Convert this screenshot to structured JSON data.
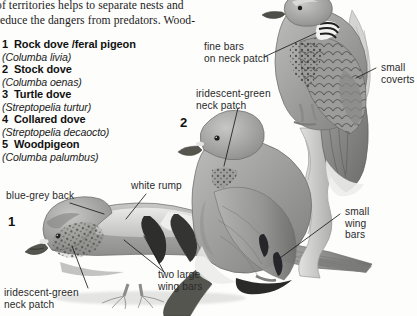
{
  "page": {
    "background_color": "#fdfdfc",
    "ink_color": "#1b1b1b"
  },
  "body_text": {
    "paragraph": "of territories helps to separate nests and\nreduce the dangers from predators. Wood-"
  },
  "species_list": [
    {
      "number": "1",
      "common_name": "Rock dove /feral pigeon",
      "latin_name": "(Columba livia)"
    },
    {
      "number": "2",
      "common_name": "Stock dove",
      "latin_name": "(Columba oenas)"
    },
    {
      "number": "3",
      "common_name": "Turtle dove",
      "latin_name": "(Streptopelia turtur)"
    },
    {
      "number": "4",
      "common_name": "Collared dove",
      "latin_name": "(Streptopelia decaocto)"
    },
    {
      "number": "5",
      "common_name": "Woodpigeon",
      "latin_name": "(Columba palumbus)"
    }
  ],
  "figure_markers": [
    {
      "label": "1"
    },
    {
      "label": "2"
    }
  ],
  "annotations": [
    {
      "id": "blue-grey-back",
      "text": "blue-grey back"
    },
    {
      "id": "white-rump",
      "text": "white rump"
    },
    {
      "id": "two-large-wing-bars",
      "text": "two large\nwing bars"
    },
    {
      "id": "iridescent-green-neck-1",
      "text": "iridescent-green\nneck patch"
    },
    {
      "id": "fine-bars-on-neck-patch",
      "text": "fine bars\non neck patch"
    },
    {
      "id": "small-coverts",
      "text": "small\ncoverts"
    },
    {
      "id": "iridescent-green-neck-2",
      "text": "iridescent-green\nneck patch"
    },
    {
      "id": "small-wing-bars",
      "text": "small\nwing\nbars"
    }
  ]
}
